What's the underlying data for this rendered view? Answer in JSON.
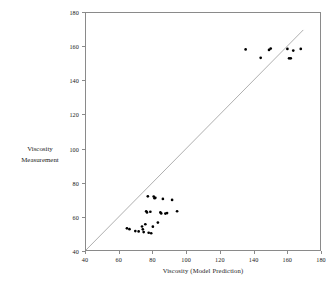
{
  "chart_data": {
    "type": "scatter",
    "title": "",
    "xlabel": "Viscosity (Model Prediction)",
    "ylabel_line1": "Viscosity",
    "ylabel_line2": "Measurement",
    "xlim": [
      40,
      180
    ],
    "ylim": [
      40,
      180
    ],
    "xticks": [
      40,
      60,
      80,
      100,
      120,
      140,
      160,
      180
    ],
    "yticks": [
      40,
      60,
      80,
      100,
      120,
      140,
      160,
      180
    ],
    "grid": false,
    "legend": "none",
    "marker_color": "#000000",
    "marker_shape": "dot",
    "frame_color": "#8a8a8a",
    "reference_line": {
      "name": "y = x identity line",
      "color": "#9a9a9a",
      "x": [
        40,
        170
      ],
      "y": [
        40,
        170
      ]
    },
    "series": [
      {
        "name": "Viscosity samples",
        "points": [
          [
            64.5,
            52.8
          ],
          [
            66.0,
            52.3
          ],
          [
            69.5,
            51.2
          ],
          [
            71.5,
            51.0
          ],
          [
            73.5,
            53.9
          ],
          [
            74.0,
            52.2
          ],
          [
            74.5,
            50.6
          ],
          [
            75.5,
            55.2
          ],
          [
            76.0,
            62.9
          ],
          [
            76.5,
            62.2
          ],
          [
            77.0,
            71.7
          ],
          [
            77.5,
            50.2
          ],
          [
            78.5,
            62.6
          ],
          [
            79.0,
            49.9
          ],
          [
            80.0,
            53.8
          ],
          [
            80.5,
            71.6
          ],
          [
            81.0,
            70.6
          ],
          [
            81.5,
            70.8
          ],
          [
            83.0,
            56.2
          ],
          [
            84.5,
            62.2
          ],
          [
            85.0,
            61.6
          ],
          [
            86.0,
            70.2
          ],
          [
            87.5,
            61.5
          ],
          [
            88.5,
            61.8
          ],
          [
            91.5,
            69.6
          ],
          [
            94.5,
            62.9
          ],
          [
            135.5,
            158.5
          ],
          [
            144.5,
            153.5
          ],
          [
            149.5,
            158.2
          ],
          [
            150.5,
            159.0
          ],
          [
            160.5,
            158.8
          ],
          [
            161.5,
            153.2
          ],
          [
            162.5,
            153.2
          ],
          [
            164.0,
            157.8
          ],
          [
            168.5,
            158.8
          ]
        ]
      }
    ]
  }
}
